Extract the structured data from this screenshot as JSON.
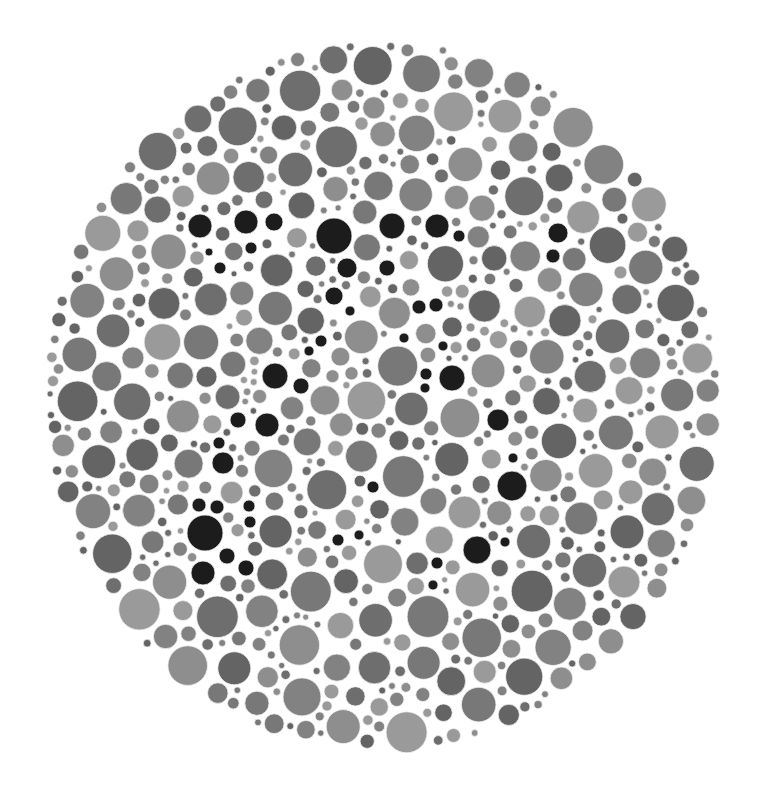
{
  "plate": {
    "type": "color-vision-test-plate",
    "hidden_figure": "77",
    "background_color": "#ffffff",
    "ellipse": {
      "cx": 382,
      "cy": 396,
      "rx": 336,
      "ry": 354
    },
    "dot_colors": [
      "#646464",
      "#6e6e6e",
      "#787878",
      "#828282",
      "#8e8e8e",
      "#9a9a9a"
    ],
    "figure_color": "#1c1c1c",
    "dot_outline_color": "#f4f4f4",
    "seed": 7731,
    "figure_dots": [
      [
        200,
        226,
        12
      ],
      [
        246,
        222,
        12
      ],
      [
        274,
        222,
        9
      ],
      [
        251,
        248,
        6
      ],
      [
        209,
        252,
        4
      ],
      [
        220,
        268,
        6
      ],
      [
        334,
        236,
        18
      ],
      [
        392,
        226,
        13
      ],
      [
        347,
        268,
        10
      ],
      [
        334,
        296,
        9
      ],
      [
        350,
        311,
        5
      ],
      [
        321,
        341,
        6
      ],
      [
        309,
        351,
        5
      ],
      [
        275,
        376,
        13
      ],
      [
        301,
        386,
        8
      ],
      [
        238,
        420,
        8
      ],
      [
        267,
        425,
        12
      ],
      [
        219,
        443,
        6
      ],
      [
        223,
        463,
        11
      ],
      [
        199,
        505,
        7
      ],
      [
        217,
        507,
        7
      ],
      [
        249,
        506,
        6
      ],
      [
        250,
        522,
        6
      ],
      [
        205,
        533,
        18
      ],
      [
        227,
        556,
        8
      ],
      [
        203,
        573,
        12
      ],
      [
        246,
        568,
        8
      ],
      [
        437,
        226,
        12
      ],
      [
        459,
        236,
        6
      ],
      [
        558,
        233,
        10
      ],
      [
        553,
        256,
        7
      ],
      [
        387,
        268,
        8
      ],
      [
        419,
        307,
        7
      ],
      [
        436,
        305,
        7
      ],
      [
        404,
        338,
        5
      ],
      [
        443,
        346,
        5
      ],
      [
        426,
        374,
        6
      ],
      [
        452,
        378,
        13
      ],
      [
        425,
        388,
        5
      ],
      [
        498,
        420,
        11
      ],
      [
        513,
        458,
        5
      ],
      [
        512,
        486,
        15
      ],
      [
        373,
        487,
        6
      ],
      [
        338,
        540,
        6
      ],
      [
        359,
        535,
        5
      ],
      [
        505,
        542,
        5
      ],
      [
        477,
        550,
        14
      ],
      [
        437,
        563,
        6
      ],
      [
        433,
        585,
        5
      ]
    ]
  },
  "caption": "Color vision test plate"
}
